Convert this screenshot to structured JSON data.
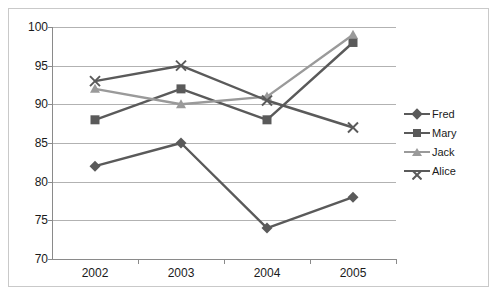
{
  "chart": {
    "title": "",
    "frame_visible": true
  },
  "chart_data": {
    "type": "line",
    "title": "",
    "subtitle": "",
    "xlabel": "",
    "ylabel": "",
    "categories": [
      "2002",
      "2003",
      "2004",
      "2005"
    ],
    "x": [
      2002,
      2003,
      2004,
      2005
    ],
    "ylim": [
      70,
      100
    ],
    "yticks": [
      70,
      75,
      80,
      85,
      90,
      95,
      100
    ],
    "ytick_labels": [
      "70",
      "75",
      "80",
      "85",
      "90",
      "95",
      "100"
    ],
    "grid": "horizontal",
    "legend_position": "right",
    "series": [
      {
        "name": "Fred",
        "marker": "diamond",
        "color": "#5a5a5a",
        "values": [
          82,
          85,
          74,
          78
        ]
      },
      {
        "name": "Mary",
        "marker": "square",
        "color": "#5a5a5a",
        "values": [
          88,
          92,
          88,
          98
        ]
      },
      {
        "name": "Jack",
        "marker": "triangle",
        "color": "#9a9a9a",
        "values": [
          92,
          90,
          91,
          99
        ]
      },
      {
        "name": "Alice",
        "marker": "x",
        "color": "#5a5a5a",
        "values": [
          93,
          95,
          90.5,
          87
        ]
      }
    ]
  },
  "axes": {
    "y_ticks": [
      {
        "label": "100",
        "value": 100
      },
      {
        "label": "95",
        "value": 95
      },
      {
        "label": "90",
        "value": 90
      },
      {
        "label": "85",
        "value": 85
      },
      {
        "label": "80",
        "value": 80
      },
      {
        "label": "75",
        "value": 75
      },
      {
        "label": "70",
        "value": 70
      }
    ],
    "x_ticks": [
      {
        "label": "2002",
        "value": 2002
      },
      {
        "label": "2003",
        "value": 2003
      },
      {
        "label": "2004",
        "value": 2004
      },
      {
        "label": "2005",
        "value": 2005
      }
    ]
  },
  "legend": {
    "items": [
      {
        "label": "Fred",
        "marker": "diamond",
        "color": "#5a5a5a"
      },
      {
        "label": "Mary",
        "marker": "square",
        "color": "#5a5a5a"
      },
      {
        "label": "Jack",
        "marker": "triangle",
        "color": "#9a9a9a"
      },
      {
        "label": "Alice",
        "marker": "x",
        "color": "#5a5a5a"
      }
    ]
  },
  "colors": {
    "grid": "#b2b2b2",
    "axis": "#8a8a8a",
    "frame": "#c9c9c9",
    "text": "#1a1a1a",
    "background": "#ffffff"
  }
}
